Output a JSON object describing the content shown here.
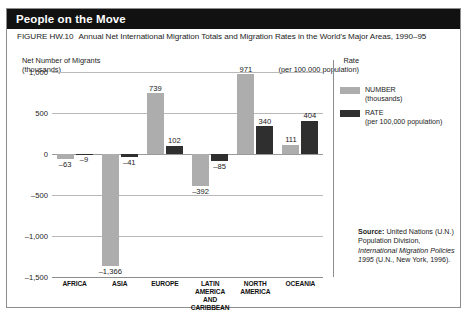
{
  "banner": {
    "title": "People on the Move"
  },
  "caption": {
    "figure_number": "FIGURE HW.10",
    "text": "Annual Net International Migration Totals and Migration Rates in the World's Major Areas, 1990–95"
  },
  "axis_left": {
    "line1": "Net Number of Migrants",
    "line2": "(thousands)"
  },
  "axis_right": {
    "line1": "Rate",
    "line2": "(per 100,000 population)"
  },
  "legend": {
    "items": [
      {
        "swatch": "number-swatch",
        "label": "NUMBER",
        "sub": "(thousands)",
        "color": "#adadad"
      },
      {
        "swatch": "rate-swatch",
        "label": "RATE",
        "sub": "(per 100,000 population)",
        "color": "#2f2f2f"
      }
    ]
  },
  "source": {
    "label": "Source:",
    "part1": " United Nations (U.N.) Population Division, ",
    "italic": "International Migration Policies 1995",
    "part2": " (U.N., New York, 1996)."
  },
  "chart_data": {
    "type": "bar",
    "title": "Annual Net International Migration Totals and Migration Rates in the World's Major Areas, 1990–95",
    "xlabel": "",
    "ylabel": "Net Number of Migrants (thousands)",
    "y2label": "Rate (per 100,000 population)",
    "ylim": [
      -1500,
      1000
    ],
    "yticks": [
      "1,000",
      "500",
      "0",
      "–500",
      "–1,000",
      "–1,500"
    ],
    "ytick_values": [
      1000,
      500,
      0,
      -500,
      -1000,
      -1500
    ],
    "grid": true,
    "legend_position": "right",
    "categories": [
      "AFRICA",
      "ASIA",
      "EUROPE",
      "LATIN AMERICA AND CARIBBEAN",
      "NORTH AMERICA",
      "OCEANIA"
    ],
    "category_lines": [
      [
        "AFRICA"
      ],
      [
        "ASIA"
      ],
      [
        "EUROPE"
      ],
      [
        "LATIN AMERICA",
        "AND CARIBBEAN"
      ],
      [
        "NORTH",
        "AMERICA"
      ],
      [
        "OCEANIA"
      ]
    ],
    "series": [
      {
        "name": "NUMBER",
        "unit": "thousands",
        "color": "#adadad",
        "values": [
          -63,
          -1366,
          739,
          -392,
          971,
          111
        ],
        "labels": [
          "–63",
          "–1,366",
          "739",
          "–392",
          "971",
          "111"
        ]
      },
      {
        "name": "RATE",
        "unit": "per 100,000 population",
        "color": "#2f2f2f",
        "values": [
          -9,
          -41,
          102,
          -85,
          340,
          404
        ],
        "labels": [
          "–9",
          "–41",
          "102",
          "–85",
          "340",
          "404"
        ]
      }
    ]
  }
}
